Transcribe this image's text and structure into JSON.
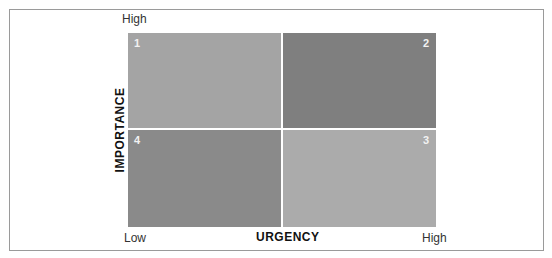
{
  "diagram": {
    "type": "priority-matrix",
    "y_axis": {
      "title": "IMPORTANCE",
      "high_label": "High"
    },
    "x_axis": {
      "title": "URGENCY",
      "low_label": "Low",
      "high_label": "High"
    },
    "quadrants": [
      {
        "number": "1",
        "position": "top-left",
        "color": "#a4a4a4"
      },
      {
        "number": "2",
        "position": "top-right",
        "color": "#7f7f7f"
      },
      {
        "number": "3",
        "position": "bottom-right",
        "color": "#ababab"
      },
      {
        "number": "4",
        "position": "bottom-left",
        "color": "#8a8a8a"
      }
    ]
  }
}
